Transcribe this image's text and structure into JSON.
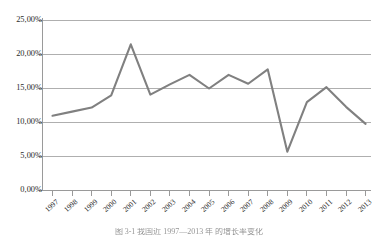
{
  "chart_data": {
    "type": "line",
    "title": "",
    "subtitle": "",
    "xlabel": "",
    "ylabel": "",
    "categories": [
      "1997",
      "1998",
      "1999",
      "2000",
      "2001",
      "2002",
      "2003",
      "2004",
      "2005",
      "2006",
      "2007",
      "2008",
      "2009",
      "2010",
      "2011",
      "2012",
      "2013"
    ],
    "series": [
      {
        "name": "",
        "values": [
          11.0,
          11.6,
          12.2,
          14.0,
          21.5,
          14.1,
          15.6,
          17.0,
          15.0,
          17.0,
          15.7,
          17.8,
          5.7,
          13.0,
          15.2,
          12.3,
          9.8
        ]
      }
    ],
    "ylim": [
      0,
      25
    ],
    "ytick_values": [
      0,
      5,
      10,
      15,
      20,
      25
    ],
    "ytick_labels": [
      "0,00%",
      "5,00%",
      "10,00%",
      "15,00%",
      "20,00%",
      "25,00%"
    ],
    "grid": "horizontal",
    "legend": "none",
    "line_color": "#808080",
    "gridline_color": "#a6a6a6",
    "axis_color": "#9a9a9a",
    "background_color": "#ffffff"
  },
  "caption": {
    "text": "图 3-1  我国近 1997—2013 年 的增长率变化"
  }
}
